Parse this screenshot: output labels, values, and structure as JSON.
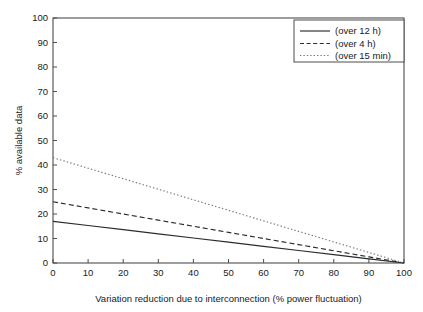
{
  "chart_data": {
    "type": "line",
    "title": "",
    "xlabel": "Variation reduction due to interconnection (% power fluctuation)",
    "ylabel": "% available data",
    "xlim": [
      0,
      100
    ],
    "ylim": [
      0,
      100
    ],
    "xticks": [
      0,
      10,
      20,
      30,
      40,
      50,
      60,
      70,
      80,
      90,
      100
    ],
    "yticks": [
      0,
      10,
      20,
      30,
      40,
      50,
      60,
      70,
      80,
      90,
      100
    ],
    "xtick_labels": [
      "0",
      "10",
      "20",
      "30",
      "40",
      "50",
      "60",
      "70",
      "80",
      "90",
      "100"
    ],
    "ytick_labels": [
      "0",
      "10",
      "20",
      "30",
      "40",
      "50",
      "60",
      "70",
      "80",
      "90",
      "100"
    ],
    "grid": false,
    "legend_position": "top-right",
    "x": [
      0,
      10,
      20,
      30,
      40,
      50,
      60,
      70,
      80,
      90,
      100
    ],
    "series": [
      {
        "name": "(over 12 h)",
        "style": "solid",
        "color": "#2b2b2b",
        "values": [
          17.0,
          15.3,
          13.6,
          11.9,
          10.2,
          8.5,
          6.8,
          5.1,
          3.4,
          1.7,
          0.0
        ]
      },
      {
        "name": "(over 4 h)",
        "style": "dashed",
        "color": "#2b2b2b",
        "values": [
          25.0,
          22.5,
          20.0,
          17.5,
          15.0,
          12.5,
          10.0,
          7.5,
          5.0,
          2.5,
          0.0
        ]
      },
      {
        "name": "(over 15 min)",
        "style": "dotted",
        "color": "#777777",
        "values": [
          43.0,
          38.7,
          34.4,
          30.1,
          25.8,
          21.5,
          17.2,
          12.9,
          8.6,
          4.3,
          0.0
        ]
      }
    ]
  },
  "legend": {
    "entries": [
      {
        "label": "(over 12 h)"
      },
      {
        "label": "(over 4 h)"
      },
      {
        "label": "(over 15 min)"
      }
    ]
  },
  "axes": {
    "x_title": "Variation reduction due to interconnection (% power fluctuation)",
    "y_title": "% available data"
  }
}
